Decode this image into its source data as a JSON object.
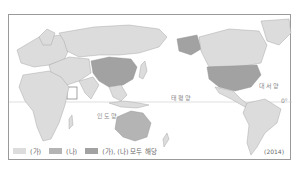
{
  "map": {
    "projection": "pacific-centered world map",
    "equator_label": "0°",
    "ocean_labels": [
      {
        "id": "indian",
        "text": "인도양"
      },
      {
        "id": "pacific",
        "text": "태평양"
      },
      {
        "id": "atlantic",
        "text": "대서양"
      }
    ],
    "colors": {
      "land_default": "#e4e4e4",
      "ga": "#dcdcdc",
      "na": "#b4b4b4",
      "both": "#a2a2a2",
      "border": "#9a9a9a"
    },
    "regions": {
      "ga": [
        "Europe",
        "Africa",
        "Russia",
        "Canada",
        "Latin America",
        "Middle East",
        "Southeast Asia",
        "Greenland"
      ],
      "na": [
        "Australia"
      ],
      "both": [
        "United States",
        "China"
      ]
    },
    "year": "(2014)"
  },
  "legend": {
    "items": [
      {
        "key": "ga",
        "label": "(가)"
      },
      {
        "key": "na",
        "label": "(나)"
      },
      {
        "key": "both",
        "label": "(가), (나) 모두 해당"
      }
    ]
  }
}
